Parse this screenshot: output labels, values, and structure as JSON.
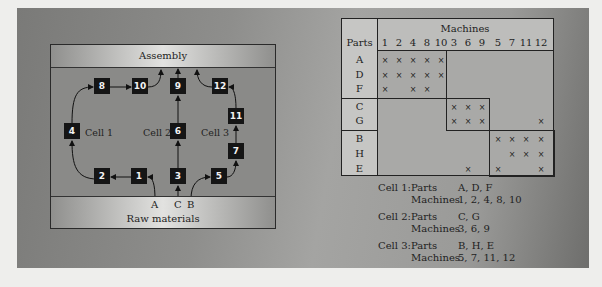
{
  "diagram": {
    "top_band": "Assembly",
    "bottom_band": "Raw materials",
    "inputs": [
      "A",
      "C",
      "B"
    ],
    "cell_labels": [
      "Cell 1",
      "Cell 2",
      "Cell 3"
    ],
    "machines": [
      {
        "id": "8",
        "x": 43,
        "y": 34
      },
      {
        "id": "10",
        "x": 81,
        "y": 34
      },
      {
        "id": "9",
        "x": 119,
        "y": 34
      },
      {
        "id": "12",
        "x": 161,
        "y": 34
      },
      {
        "id": "4",
        "x": 13,
        "y": 79
      },
      {
        "id": "6",
        "x": 119,
        "y": 79
      },
      {
        "id": "11",
        "x": 177,
        "y": 64
      },
      {
        "id": "7",
        "x": 177,
        "y": 99
      },
      {
        "id": "2",
        "x": 43,
        "y": 124
      },
      {
        "id": "1",
        "x": 80,
        "y": 124
      },
      {
        "id": "3",
        "x": 119,
        "y": 124
      },
      {
        "id": "5",
        "x": 160,
        "y": 124
      }
    ]
  },
  "matrix": {
    "title": "Machines",
    "parts_header": "Parts",
    "columns": [
      "1",
      "2",
      "4",
      "8",
      "10",
      "3",
      "6",
      "9",
      "5",
      "7",
      "11",
      "12"
    ],
    "rows": [
      {
        "part": "A",
        "marks": [
          "1",
          "2",
          "4",
          "8",
          "10"
        ]
      },
      {
        "part": "D",
        "marks": [
          "1",
          "2",
          "4",
          "8",
          "10"
        ]
      },
      {
        "part": "F",
        "marks": [
          "1",
          "4",
          "8"
        ]
      },
      {
        "part": "C",
        "marks": [
          "3",
          "6",
          "9"
        ]
      },
      {
        "part": "G",
        "marks": [
          "3",
          "6",
          "9",
          "12"
        ]
      },
      {
        "part": "B",
        "marks": [
          "5",
          "7",
          "11",
          "12"
        ]
      },
      {
        "part": "H",
        "marks": [
          "7",
          "11",
          "12"
        ]
      },
      {
        "part": "E",
        "marks": [
          "6",
          "5",
          "12"
        ]
      }
    ],
    "mark_symbol": "×"
  },
  "legend": [
    {
      "cell": "Cell 1:",
      "parts_label": "Parts",
      "parts": "A, D, F",
      "machines_label": "Machines",
      "machines": "1, 2, 4, 8, 10"
    },
    {
      "cell": "Cell 2:",
      "parts_label": "Parts",
      "parts": "C, G",
      "machines_label": "Machines",
      "machines": "3, 6, 9"
    },
    {
      "cell": "Cell 3:",
      "parts_label": "Parts",
      "parts": "B, H, E",
      "machines_label": "Machines",
      "machines": "5, 7, 11, 12"
    }
  ]
}
